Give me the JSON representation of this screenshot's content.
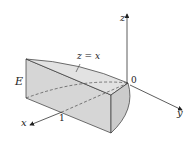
{
  "diagram": {
    "labels": {
      "region": "E",
      "surface": "z = x",
      "origin": "0",
      "x_axis": "x",
      "y_axis": "y",
      "z_axis": "z",
      "x_tick": "1"
    },
    "colors": {
      "face": "#d9d9d9",
      "top_face": "#e4e4e4",
      "curved_face": "#cfcfcf",
      "edge": "#333333"
    }
  }
}
